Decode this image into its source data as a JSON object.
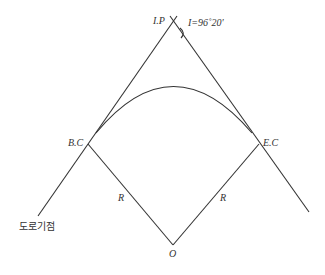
{
  "diagram": {
    "labels": {
      "ip": "I.P",
      "angle": "I=96˚20′",
      "bc": "B.C",
      "ec": "E.C",
      "radius_left": "R",
      "radius_right": "R",
      "center": "O",
      "road_start": "도로기점"
    },
    "intersection_angle_deg": 96.333,
    "colors": {
      "line": "#333333",
      "text": "#333333",
      "background": "#ffffff"
    }
  }
}
